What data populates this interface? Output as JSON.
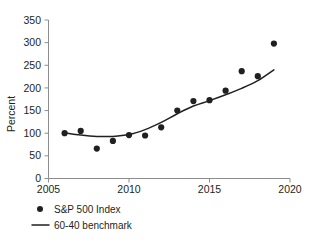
{
  "chart_data": {
    "type": "scatter",
    "title": "",
    "subtitle": "",
    "xlabel": "",
    "ylabel": "Percent",
    "xlim": [
      2005,
      2020
    ],
    "ylim": [
      0,
      350
    ],
    "grid": false,
    "legend_position": "bottom-left",
    "x_ticks": [
      "2005",
      "2010",
      "2015",
      "2020"
    ],
    "x_tick_values": [
      2005,
      2010,
      2015,
      2020
    ],
    "y_ticks": [
      "0",
      "50",
      "100",
      "150",
      "200",
      "250",
      "300",
      "350"
    ],
    "y_tick_values": [
      0,
      50,
      100,
      150,
      200,
      250,
      300,
      350
    ],
    "x": [
      2006,
      2007,
      2008,
      2009,
      2010,
      2011,
      2012,
      2013,
      2014,
      2015,
      2016,
      2017,
      2018,
      2019
    ],
    "series": [
      {
        "name": "S&P 500 Index",
        "render": "points",
        "marker": "circle",
        "color": "#231f20",
        "values": [
          100,
          105,
          66,
          83,
          96,
          95,
          113,
          150,
          171,
          173,
          194,
          237,
          226,
          298
        ]
      },
      {
        "name": "60-40 benchmark",
        "render": "line",
        "color": "#231f20",
        "x": [
          2006,
          2007,
          2008,
          2009,
          2010,
          2011,
          2012,
          2013,
          2014,
          2015,
          2016,
          2017,
          2018,
          2019
        ],
        "values": [
          101,
          96,
          93,
          93,
          97,
          108,
          124,
          143,
          160,
          172,
          185,
          199,
          216,
          240
        ]
      }
    ],
    "annotations": []
  },
  "legend": {
    "items": [
      {
        "label": "S&P 500 Index",
        "marker": "dot",
        "color": "#231f20"
      },
      {
        "label": "60-40 benchmark",
        "marker": "line",
        "color": "#231f20"
      }
    ]
  },
  "axes": {
    "y_title": "Percent"
  },
  "colors": {
    "background": "#ffffff",
    "foreground": "#231f20",
    "axis": "#8d8d8d"
  }
}
